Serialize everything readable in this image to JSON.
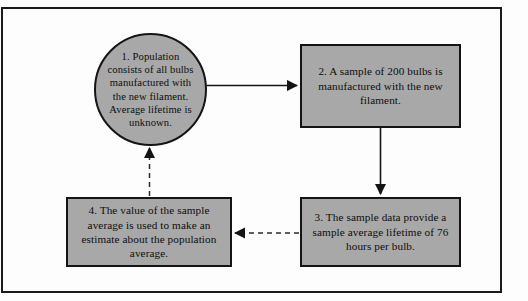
{
  "diagram": {
    "frame": {
      "border_color": "#1a1a1a"
    },
    "node_fill": "#a8a8a8",
    "node_stroke": "#141414",
    "nodes": [
      {
        "id": "node-1",
        "shape": "ellipse",
        "number": "1.",
        "text": "1.  Population consists of all bulbs manufactured with the new filament. Average lifetime is unknown.",
        "role": "population"
      },
      {
        "id": "node-2",
        "shape": "rectangle",
        "number": "2.",
        "text": "2.  A sample of 200 bulbs is manufactured with the new filament.",
        "role": "sample"
      },
      {
        "id": "node-3",
        "shape": "rectangle",
        "number": "3.",
        "text": "3.  The sample data provide a sample average lifetime of 76 hours per bulb.",
        "role": "sample-statistic"
      },
      {
        "id": "node-4",
        "shape": "rectangle",
        "number": "4.",
        "text": "4.  The value of the sample average is used to make an estimate about the population average.",
        "role": "inference"
      }
    ],
    "edges": [
      {
        "id": "edge-1-2",
        "from": "node-1",
        "to": "node-2",
        "style": "solid",
        "direction": "right",
        "label": ""
      },
      {
        "id": "edge-2-3",
        "from": "node-2",
        "to": "node-3",
        "style": "solid",
        "direction": "down",
        "label": ""
      },
      {
        "id": "edge-3-4",
        "from": "node-3",
        "to": "node-4",
        "style": "dashed",
        "direction": "left",
        "label": ""
      },
      {
        "id": "edge-4-1",
        "from": "node-4",
        "to": "node-1",
        "style": "dashed",
        "direction": "up",
        "label": ""
      }
    ]
  }
}
